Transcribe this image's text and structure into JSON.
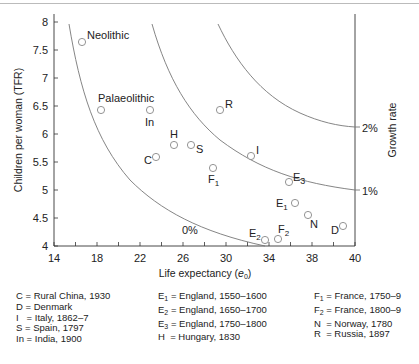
{
  "chart_data": {
    "type": "scatter",
    "title": "",
    "xlabel": "Life expectancy (e0)",
    "ylabel": "Children per woman (TFR)",
    "right_label": "Growth rate",
    "x_ticks": [
      "14",
      "18",
      "22",
      "26",
      "30",
      "34",
      "38",
      "40"
    ],
    "y_ticks": [
      "8",
      "7.5",
      "7",
      "6.5",
      "6",
      "5.5",
      "5",
      "4.5",
      "4"
    ],
    "xlim": [
      14,
      40
    ],
    "ylim": [
      4,
      8.1
    ],
    "grid": false,
    "curves": [
      {
        "name": "0%",
        "label": "0%"
      },
      {
        "name": "1%",
        "label": "1%"
      },
      {
        "name": "2%",
        "label": "2%"
      }
    ],
    "points": [
      {
        "label": "Neolithic",
        "x": 16.4,
        "y": 7.64
      },
      {
        "label": "Palaeolithic",
        "x": 18.1,
        "y": 6.43
      },
      {
        "label": "In",
        "x": 22.3,
        "y": 6.43
      },
      {
        "label": "H",
        "x": 24.3,
        "y": 5.8
      },
      {
        "label": "S",
        "x": 25.8,
        "y": 5.8
      },
      {
        "label": "C",
        "x": 22.8,
        "y": 5.59
      },
      {
        "label": "R",
        "x": 28.3,
        "y": 6.43
      },
      {
        "label": "F1",
        "x": 27.7,
        "y": 5.39
      },
      {
        "label": "I",
        "x": 31.0,
        "y": 5.61
      },
      {
        "label": "E3",
        "x": 34.3,
        "y": 5.14
      },
      {
        "label": "E1",
        "x": 34.8,
        "y": 4.77
      },
      {
        "label": "N",
        "x": 35.9,
        "y": 4.55
      },
      {
        "label": "D",
        "x": 38.9,
        "y": 4.36
      },
      {
        "label": "E2",
        "x": 32.2,
        "y": 4.11
      },
      {
        "label": "F2",
        "x": 33.3,
        "y": 4.12
      }
    ]
  },
  "labels": {
    "xlabel_main": "Life expectancy (",
    "xlabel_e": "e",
    "xlabel_sub": "0",
    "xlabel_end": ")",
    "ylabel": "Children per woman (TFR)",
    "right_label": "Growth rate",
    "pct0": "0%",
    "pct1": "1%",
    "pct2": "2%"
  },
  "legend": {
    "col1": [
      {
        "key": "C",
        "sub": "",
        "text": " = Rural China, 1930"
      },
      {
        "key": "D",
        "sub": "",
        "text": " = Denmark"
      },
      {
        "key": "I",
        "sub": "",
        "text": "   = Italy, 1862–7"
      },
      {
        "key": "S",
        "sub": "",
        "text": " = Spain, 1797"
      },
      {
        "key": "In",
        "sub": "",
        "text": " = India, 1900"
      }
    ],
    "col2": [
      {
        "key": "E",
        "sub": "1",
        "text": " = England, 1550–1600"
      },
      {
        "key": "E",
        "sub": "2",
        "text": " = England, 1650–1700"
      },
      {
        "key": "E",
        "sub": "3",
        "text": " = England, 1750–1800"
      },
      {
        "key": "H",
        "sub": "",
        "text": "  = Hungary, 1830"
      }
    ],
    "col3": [
      {
        "key": "F",
        "sub": "1",
        "text": " = France, 1750–9"
      },
      {
        "key": "F",
        "sub": "2",
        "text": " = France, 1800–9"
      },
      {
        "key": "N",
        "sub": "",
        "text": "  = Norway, 1780"
      },
      {
        "key": "R",
        "sub": "",
        "text": "  = Russia, 1897"
      }
    ]
  }
}
